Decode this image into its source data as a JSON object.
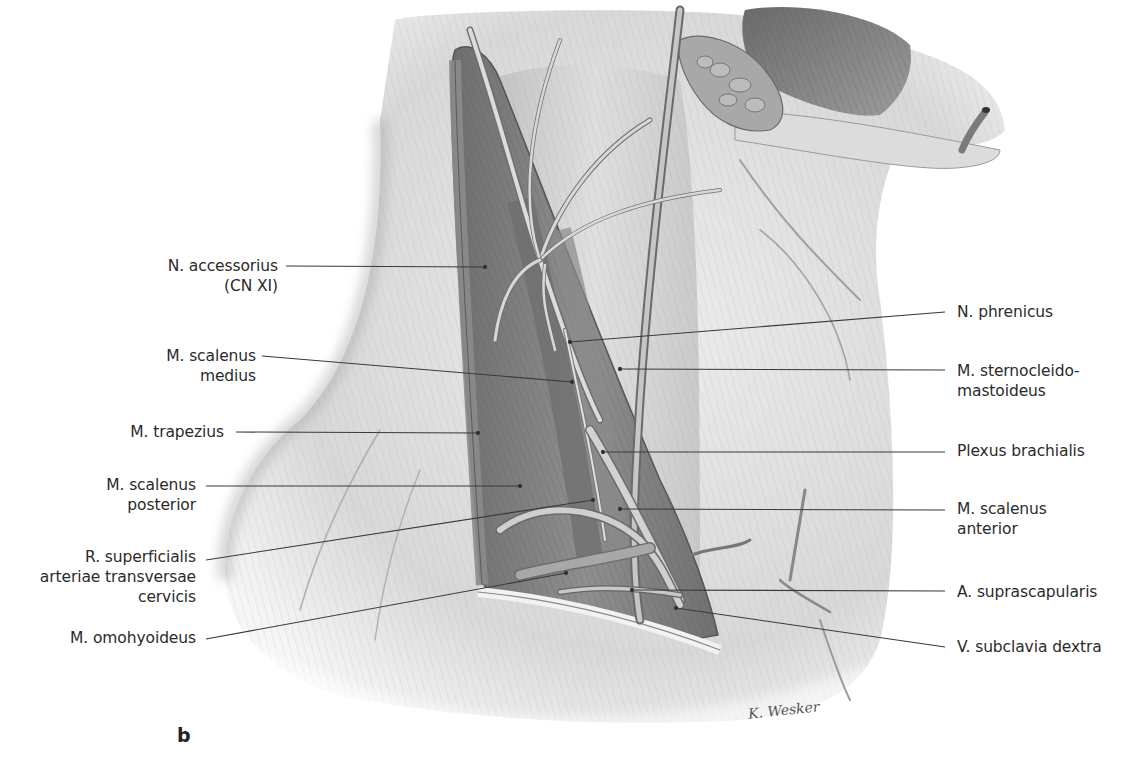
{
  "figure": {
    "panel_letter": "b",
    "signature": "K. Wesker",
    "style": "grayscale pencil anatomical illustration"
  },
  "labels": {
    "left": [
      {
        "id": "n-accessorius",
        "text": "N. accessorius\n(CN XI)",
        "x": 150,
        "y": 256,
        "w": 128,
        "line": {
          "x1": 286,
          "y1": 266,
          "x2": 485,
          "y2": 267
        }
      },
      {
        "id": "m-scalenus-medius",
        "text": "M. scalenus\nmedius",
        "x": 138,
        "y": 346,
        "w": 118,
        "line": {
          "x1": 262,
          "y1": 356,
          "x2": 572,
          "y2": 382
        }
      },
      {
        "id": "m-trapezius",
        "text": "M. trapezius",
        "x": 112,
        "y": 422,
        "w": 112,
        "line": {
          "x1": 236,
          "y1": 432,
          "x2": 478,
          "y2": 433
        }
      },
      {
        "id": "m-scalenus-posterior",
        "text": "M. scalenus\nposterior",
        "x": 98,
        "y": 475,
        "w": 98,
        "line": {
          "x1": 206,
          "y1": 486,
          "x2": 520,
          "y2": 486
        }
      },
      {
        "id": "r-superficialis",
        "text": "R. superficialis\narteriae transversae\ncervicis",
        "x": 20,
        "y": 547,
        "w": 176,
        "line": {
          "x1": 206,
          "y1": 560,
          "x2": 593,
          "y2": 500
        }
      },
      {
        "id": "m-omohyoideus",
        "text": "M. omohyoideus",
        "x": 52,
        "y": 628,
        "w": 144,
        "line": {
          "x1": 206,
          "y1": 639,
          "x2": 566,
          "y2": 573
        }
      }
    ],
    "right": [
      {
        "id": "n-phrenicus",
        "text": "N. phrenicus",
        "x": 957,
        "y": 302,
        "line": {
          "x1": 945,
          "y1": 312,
          "x2": 570,
          "y2": 342
        }
      },
      {
        "id": "m-sternocleidomastoideus",
        "text": "M. sternocleido-\nmastoideus",
        "x": 957,
        "y": 361,
        "line": {
          "x1": 945,
          "y1": 370,
          "x2": 620,
          "y2": 369
        }
      },
      {
        "id": "plexus-brachialis",
        "text": "Plexus brachialis",
        "x": 957,
        "y": 441,
        "line": {
          "x1": 945,
          "y1": 452,
          "x2": 603,
          "y2": 452
        }
      },
      {
        "id": "m-scalenus-anterior",
        "text": "M. scalenus\nanterior",
        "x": 957,
        "y": 499,
        "line": {
          "x1": 945,
          "y1": 510,
          "x2": 620,
          "y2": 509
        }
      },
      {
        "id": "a-suprascapularis",
        "text": "A. suprascapularis",
        "x": 957,
        "y": 582,
        "line": {
          "x1": 945,
          "y1": 591,
          "x2": 632,
          "y2": 590
        }
      },
      {
        "id": "v-subclavia-dextra",
        "text": "V. subclavia dextra",
        "x": 957,
        "y": 637,
        "line": {
          "x1": 945,
          "y1": 647,
          "x2": 676,
          "y2": 608
        }
      }
    ]
  },
  "colors": {
    "background": "#ffffff",
    "skin_light": "#e4e4e4",
    "skin_mid": "#c9c9c9",
    "muscle_dark": "#7d7d7d",
    "muscle_mid": "#9a9a9a",
    "nerve_fill": "#d6d6d6",
    "outline": "#5e5e5e",
    "leader_line": "#3a3a3a",
    "text": "#2b2b2b"
  }
}
